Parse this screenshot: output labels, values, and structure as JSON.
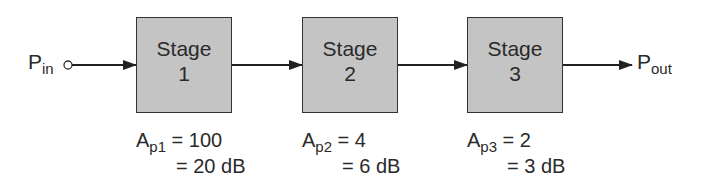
{
  "diagram": {
    "type": "block-diagram",
    "input": {
      "symbol": "P",
      "subscript": "in"
    },
    "output": {
      "symbol": "P",
      "subscript": "out"
    },
    "stages": [
      {
        "title": "Stage",
        "number": "1",
        "gain_symbol": "A",
        "gain_subscript": "p1",
        "gain_ratio": "= 100",
        "gain_db": "= 20 dB"
      },
      {
        "title": "Stage",
        "number": "2",
        "gain_symbol": "A",
        "gain_subscript": "p2",
        "gain_ratio": "= 4",
        "gain_db": "= 6 dB"
      },
      {
        "title": "Stage",
        "number": "3",
        "gain_symbol": "A",
        "gain_subscript": "p3",
        "gain_ratio": "= 2",
        "gain_db": "= 3 dB"
      }
    ],
    "colors": {
      "box_fill": "#c4c4c4",
      "stroke": "#333333",
      "text": "#2a2a2a"
    }
  }
}
